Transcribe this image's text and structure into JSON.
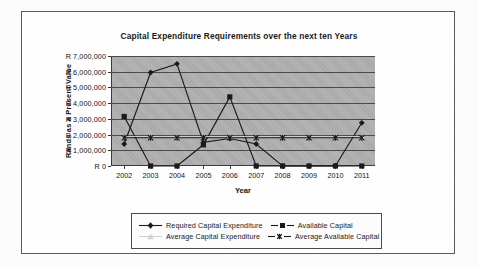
{
  "chart_data": {
    "type": "line",
    "title": "Capital Expenditure Requirements over the next ten Years",
    "xlabel": "Year",
    "ylabel": "Rands as a Present Value",
    "categories": [
      "2002",
      "2003",
      "2004",
      "2005",
      "2006",
      "2007",
      "2008",
      "2009",
      "2010",
      "2011"
    ],
    "ylim": [
      0,
      7000000
    ],
    "ytick_labels": [
      "R 0",
      "R 1,000,000",
      "R 2,000,000",
      "R 3,000,000",
      "R 4,000,000",
      "R 5,000,000",
      "R 6,000,000",
      "R 7,000,000"
    ],
    "ytick_values": [
      0,
      1000000,
      2000000,
      3000000,
      4000000,
      5000000,
      6000000,
      7000000
    ],
    "grid": "horizontal",
    "legend_position": "bottom",
    "plot_background": "#a8a8a8",
    "series": [
      {
        "name": "Required Capital Expenditure",
        "marker": "diamond",
        "color": "#1a1a1a",
        "values": [
          1400000,
          5950000,
          6500000,
          1500000,
          1750000,
          1400000,
          0,
          0,
          0,
          2750000
        ]
      },
      {
        "name": "Available Capital",
        "marker": "square",
        "color": "#1a1a1a",
        "values": [
          3150000,
          0,
          0,
          1350000,
          4400000,
          0,
          0,
          0,
          0,
          0
        ]
      },
      {
        "name": "Average Capital Expenditure",
        "marker": "triangle",
        "color": "#d2d2d2",
        "values": [
          1880000,
          1880000,
          1880000,
          1880000,
          1880000,
          1880000,
          1880000,
          1880000,
          1880000,
          1880000
        ]
      },
      {
        "name": "Average Available Capital",
        "marker": "cross",
        "color": "#1a1a1a",
        "values": [
          1800000,
          1800000,
          1800000,
          1800000,
          1800000,
          1800000,
          1800000,
          1800000,
          1800000,
          1800000
        ]
      }
    ]
  }
}
